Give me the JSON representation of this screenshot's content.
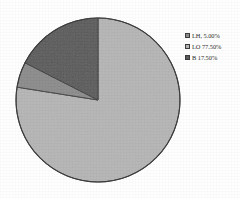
{
  "chart_data": {
    "type": "pie",
    "title": "",
    "subtitle": "",
    "xlabel": "",
    "ylabel": "",
    "grid": false,
    "legend_position": "right",
    "start_angle_deg": 0,
    "direction": "clockwise",
    "categories": [
      "LH",
      "LO",
      "B"
    ],
    "values": [
      5.0,
      77.5,
      17.5
    ],
    "unit": "%",
    "labels": [
      "LH, 5.00%",
      "LO 77.50%",
      "B 17.50%"
    ],
    "slices": [
      {
        "name": "LH",
        "value": 5.0,
        "display": "5.00%",
        "legend_text": "LH, 5.00%",
        "color": "#8a8a8a"
      },
      {
        "name": "LO",
        "value": 77.5,
        "display": "77.50%",
        "legend_text": "LO 77.50%",
        "color": "#b5b5b5"
      },
      {
        "name": "B",
        "value": 17.5,
        "display": "17.50%",
        "legend_text": "B 17.50%",
        "color": "#585858"
      }
    ]
  },
  "pie": {
    "center_x": 98,
    "center_y": 100,
    "radius": 82,
    "outline_color": "#3a3a3a",
    "background": "#fefefe"
  },
  "legend": {
    "rows": [
      {
        "swatch_color": "#8a8a8a",
        "label": "LH, 5.00%"
      },
      {
        "swatch_color": "#b5b5b5",
        "label": "LO 77.50%"
      },
      {
        "swatch_color": "#585858",
        "label": "B 17.50%"
      }
    ]
  },
  "colors": {
    "slice_lh": "#8a8a8a",
    "slice_lo": "#b5b5b5",
    "slice_b": "#585858",
    "outline": "#3a3a3a",
    "text": "#2b2b2b",
    "background": "#fefefe"
  }
}
